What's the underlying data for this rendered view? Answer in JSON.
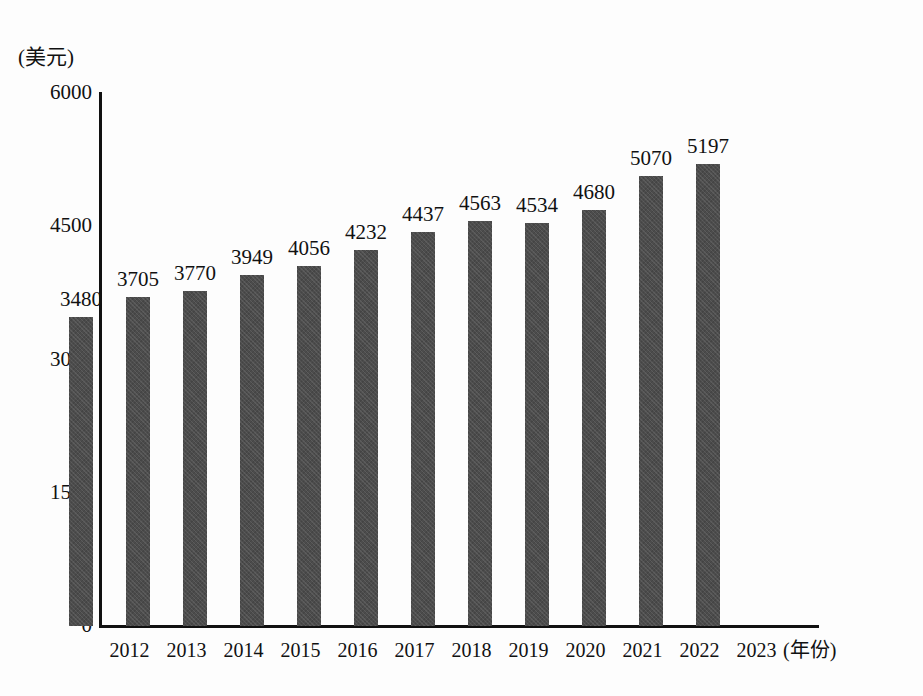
{
  "chart_data": {
    "type": "bar",
    "title": "",
    "subtitle": "",
    "xlabel": "(年份)",
    "ylabel": "(美元)",
    "categories": [
      "2012",
      "2013",
      "2014",
      "2015",
      "2016",
      "2017",
      "2018",
      "2019",
      "2020",
      "2021",
      "2022",
      "2023"
    ],
    "values": [
      3480,
      3705,
      3770,
      3949,
      4056,
      4232,
      4437,
      4563,
      4534,
      4680,
      5070,
      5197
    ],
    "data_labels": [
      "3480",
      "3705",
      "3770",
      "3949",
      "4056",
      "4232",
      "4437",
      "4563",
      "4534",
      "4680",
      "5070",
      "5197"
    ],
    "ylim": [
      0,
      6000
    ],
    "y_ticks": [
      0,
      1500,
      3000,
      4500,
      6000
    ],
    "y_tick_labels": [
      "0",
      "1500",
      "3000",
      "4500",
      "6000"
    ],
    "x_tick_labels": [
      "2012",
      "2013",
      "2014",
      "2015",
      "2016",
      "2017",
      "2018",
      "2019",
      "2020",
      "2021",
      "2022",
      "2023"
    ],
    "grid": false,
    "legend": null,
    "bar_color": "#4c4c4c",
    "axis_color": "#111111",
    "background_color": "#fdfdfd"
  }
}
